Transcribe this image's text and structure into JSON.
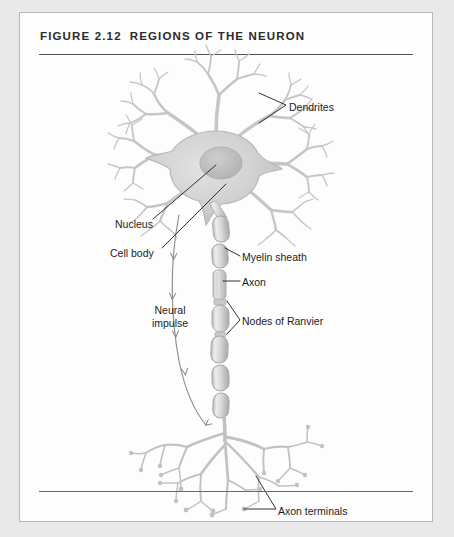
{
  "figure": {
    "number": "FIGURE 2.12",
    "title": "REGIONS OF THE NEURON",
    "caption_divider": true
  },
  "colors": {
    "page_background": "#e9e9e9",
    "panel_background": "#fdfdfd",
    "panel_border": "#b9b9b9",
    "rule": "#555555",
    "title_text": "#2b2b2b",
    "label_text": "#1c1c1c",
    "leader_line": "#1c1c1c",
    "cell_fill": "#cfcfcf",
    "cell_stroke": "#b5b5b5",
    "nucleus_fill": "#c0c0c0",
    "myelin_fill": "#d2d2d2",
    "myelin_highlight": "#efefef",
    "impulse_arrow": "#8e8e8e"
  },
  "labels": [
    {
      "id": "dendrites",
      "text": "Dendrites",
      "name": "label-dendrites",
      "leader": "bracket",
      "points_to": "dendrite branches, upper right"
    },
    {
      "id": "nucleus",
      "text": "Nucleus",
      "name": "label-nucleus",
      "leader": "line",
      "points_to": "nucleus oval inside soma"
    },
    {
      "id": "cell_body",
      "text": "Cell body",
      "name": "label-cell-body",
      "leader": "line",
      "points_to": "soma"
    },
    {
      "id": "myelin_sheath",
      "text": "Myelin sheath",
      "name": "label-myelin-sheath",
      "leader": "line",
      "points_to": "myelin segment on axon"
    },
    {
      "id": "axon",
      "text": "Axon",
      "name": "label-axon",
      "leader": "line",
      "points_to": "bare axon fiber between myelin segments"
    },
    {
      "id": "neural_impulse",
      "text": "Neural impulse",
      "line1": "Neural",
      "line2": "impulse",
      "name": "label-neural-impulse",
      "leader": "curved arrow chain",
      "points_to": "direction of signal travel down the axon"
    },
    {
      "id": "nodes_of_ranvier",
      "text": "Nodes of Ranvier",
      "name": "label-nodes-of-ranvier",
      "leader": "bracket",
      "points_to": "two gaps between myelin segments"
    },
    {
      "id": "axon_terminals",
      "text": "Axon terminals",
      "name": "label-axon-terminals",
      "leader": "bracket",
      "points_to": "terminal branch endings"
    }
  ],
  "anatomy": {
    "parts": [
      "Dendrites",
      "Nucleus",
      "Cell body",
      "Myelin sheath",
      "Axon",
      "Nodes of Ranvier",
      "Axon terminals"
    ],
    "impulse_direction": "downward, from cell body toward axon terminals"
  }
}
